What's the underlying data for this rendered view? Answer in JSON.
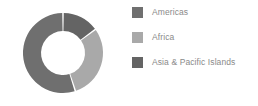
{
  "chart_data": {
    "type": "pie",
    "variant": "donut",
    "title": "",
    "subtitle": "",
    "xlabel": "",
    "ylabel": "",
    "grid": false,
    "legend_position": "right",
    "start_angle_deg": 0,
    "direction": "counterclockwise",
    "inner_radius_ratio": 0.55,
    "categories": [
      "Americas",
      "Africa",
      "Asia & Pacific Islands"
    ],
    "values": [
      55,
      30,
      15
    ],
    "slices": [
      {
        "label": "Americas",
        "value": 55,
        "percent": 55,
        "color": "#6f6f6f",
        "start_angle_deg": 0,
        "end_angle_deg": 198
      },
      {
        "label": "Africa",
        "value": 30,
        "percent": 30,
        "color": "#a9a9a9",
        "start_angle_deg": 198,
        "end_angle_deg": 306
      },
      {
        "label": "Asia & Pacific Islands",
        "value": 15,
        "percent": 15,
        "color": "#646464",
        "start_angle_deg": 306,
        "end_angle_deg": 360
      }
    ],
    "annotations": []
  },
  "legend": {
    "items": [
      {
        "label": "Americas",
        "color": "#6f6f6f",
        "swatch_name": "legend-swatch-americas"
      },
      {
        "label": "Africa",
        "color": "#a9a9a9",
        "swatch_name": "legend-swatch-africa"
      },
      {
        "label": "Asia & Pacific Islands",
        "color": "#646464",
        "swatch_name": "legend-swatch-asia-pacific-islands"
      }
    ]
  },
  "style": {
    "background": "#ffffff",
    "label_color": "#8a8a8a",
    "slice_gap_color": "#ffffff"
  }
}
